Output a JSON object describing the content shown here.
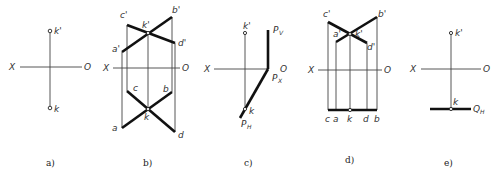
{
  "figure": {
    "panels": [
      {
        "id": "a",
        "caption": "a)",
        "axis": {
          "left_label": "X",
          "right_label": "O"
        },
        "points": {
          "front": "k'",
          "top": "k"
        }
      },
      {
        "id": "b",
        "caption": "b)",
        "axis": {
          "left_label": "X",
          "right_label": "O"
        },
        "points": {
          "a1": "a'",
          "b1": "b'",
          "c1": "c'",
          "d1": "d'",
          "k1": "k'",
          "a": "a",
          "b": "b",
          "c": "c",
          "d": "d",
          "k": "k"
        }
      },
      {
        "id": "c",
        "caption": "c)",
        "axis": {
          "left_label": "X",
          "right_label": "O"
        },
        "points": {
          "front": "k'",
          "top": "k"
        },
        "traces": {
          "pv": "P",
          "pv_sub": "V",
          "px": "P",
          "px_sub": "X",
          "ph": "P",
          "ph_sub": "H"
        }
      },
      {
        "id": "d",
        "caption": "d)",
        "axis": {
          "left_label": "X",
          "right_label": "O"
        },
        "points": {
          "a1": "a'",
          "b1": "b'",
          "c1": "c'",
          "d1": "d'",
          "k1": "k'",
          "c": "c",
          "a": "a",
          "k": "k",
          "d": "d",
          "b": "b"
        }
      },
      {
        "id": "e",
        "caption": "e)",
        "axis": {
          "left_label": "X",
          "right_label": "O"
        },
        "points": {
          "front": "k'",
          "top": "k"
        },
        "traces": {
          "qh": "Q",
          "qh_sub": "H"
        }
      }
    ]
  }
}
